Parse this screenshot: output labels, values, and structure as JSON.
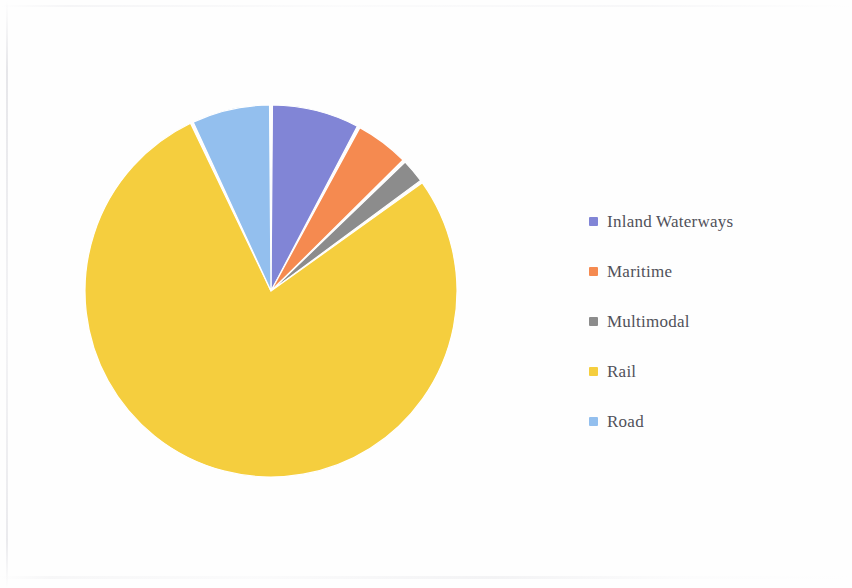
{
  "document": {
    "background_color": "#fefefe",
    "page_width": 852,
    "page_height": 588
  },
  "legend": {
    "position": "right",
    "items": [
      {
        "label": "Inland Waterways",
        "color": "#8185d6",
        "swatch_name": "legend-swatch-inland-waterways"
      },
      {
        "label": "Maritime",
        "color": "#f58a50",
        "swatch_name": "legend-swatch-maritime"
      },
      {
        "label": "Multimodal",
        "color": "#8c8c8c",
        "swatch_name": "legend-swatch-multimodal"
      },
      {
        "label": "Rail",
        "color": "#f5ce3e",
        "swatch_name": "legend-swatch-rail"
      },
      {
        "label": "Road",
        "color": "#93bfee",
        "swatch_name": "legend-swatch-road"
      }
    ]
  },
  "chart_data": {
    "type": "pie",
    "title": "",
    "subtitle": "",
    "xlabel": "",
    "ylabel": "",
    "legend_position": "right",
    "grid": false,
    "start_angle_deg": 0,
    "direction": "clockwise",
    "slice_gap_deg": 0.9,
    "slice_border_color": "#ffffff",
    "categories": [
      "Inland Waterways",
      "Maritime",
      "Multimodal",
      "Rail",
      "Road"
    ],
    "values": [
      7.8,
      4.9,
      2.3,
      78.0,
      7.0
    ],
    "unit": "percent",
    "colors": [
      "#8185d6",
      "#f58a50",
      "#8c8c8c",
      "#f5ce3e",
      "#93bfee"
    ],
    "slices": [
      {
        "name": "Inland Waterways",
        "value": 7.8,
        "color": "#8185d6",
        "start_deg": 0.0,
        "end_deg": 28.1
      },
      {
        "name": "Maritime",
        "value": 4.9,
        "color": "#f58a50",
        "start_deg": 28.1,
        "end_deg": 45.7
      },
      {
        "name": "Multimodal",
        "value": 2.3,
        "color": "#8c8c8c",
        "start_deg": 45.7,
        "end_deg": 54.0
      },
      {
        "name": "Rail",
        "value": 78.0,
        "color": "#f5ce3e",
        "start_deg": 54.0,
        "end_deg": 334.8
      },
      {
        "name": "Road",
        "value": 7.0,
        "color": "#93bfee",
        "start_deg": 334.8,
        "end_deg": 360.0
      }
    ],
    "geometry": {
      "center_x": 200,
      "center_y": 200,
      "radius": 186
    }
  }
}
